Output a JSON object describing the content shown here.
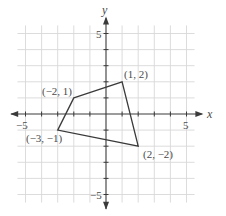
{
  "chart_data": {
    "type": "diagram",
    "title": "",
    "xlabel": "x",
    "ylabel": "y",
    "xlim": [
      -5,
      5
    ],
    "ylim": [
      -5,
      5
    ],
    "grid": true,
    "tick_labels": {
      "x_neg": "−5",
      "x_pos": "5",
      "y_pos": "5",
      "y_neg": "−5"
    },
    "polygon": {
      "vertices": [
        {
          "x": -2,
          "y": 1,
          "label": "(−2, 1)"
        },
        {
          "x": 1,
          "y": 2,
          "label": "(1, 2)"
        },
        {
          "x": 2,
          "y": -2,
          "label": "(2, −2)"
        },
        {
          "x": -3,
          "y": -1,
          "label": "(−3, −1)"
        }
      ]
    }
  },
  "colors": {
    "grid": "#d8d8d8",
    "axis": "#3a3a3a",
    "polygon": "#3a3a3a",
    "text": "#4a4a4a"
  }
}
